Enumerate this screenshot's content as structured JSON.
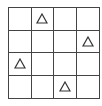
{
  "board": {
    "rows": 4,
    "cols": 4,
    "line_color": "#444444",
    "background": "#ffffff",
    "cells": [
      [
        "",
        "triangle",
        "",
        ""
      ],
      [
        "",
        "",
        "",
        "triangle"
      ],
      [
        "triangle",
        "",
        "",
        ""
      ],
      [
        "",
        "",
        "triangle",
        ""
      ]
    ],
    "marker": {
      "shape": "triangle-outline-icon",
      "color": "#333333"
    }
  }
}
